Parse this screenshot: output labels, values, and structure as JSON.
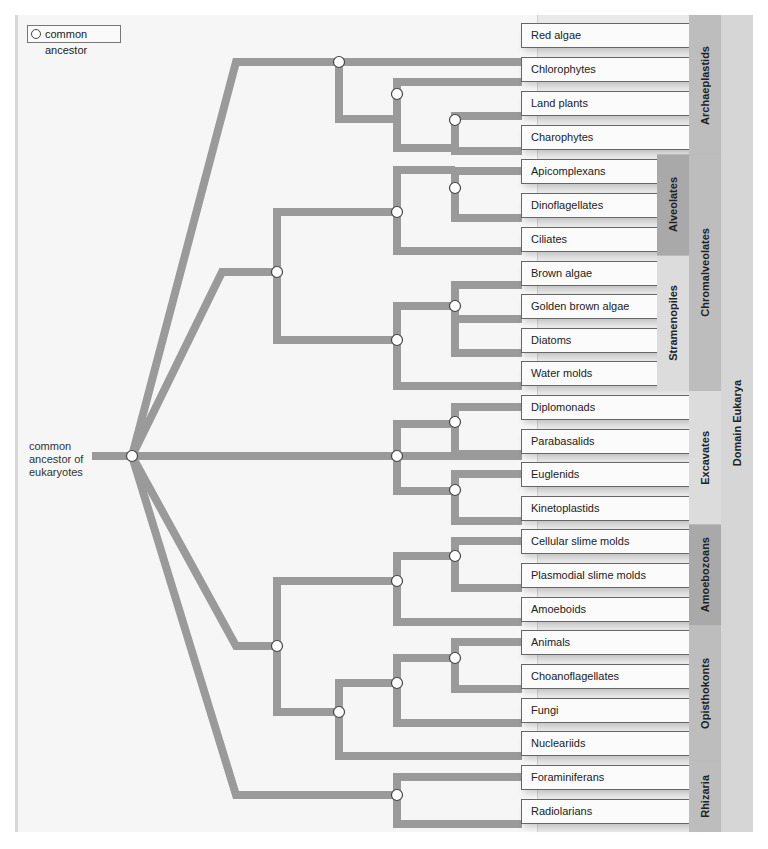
{
  "legend": {
    "label": "common ancestor",
    "icon": "circle-node-icon"
  },
  "root": {
    "label_lines": [
      "common",
      "ancestor of",
      "eukaryotes"
    ]
  },
  "colors": {
    "branch": "#9a9a9a",
    "node_fill": "#ffffff",
    "node_stroke": "#444444",
    "panel": "#f6f6f6",
    "label_panel": "#e9e9e9",
    "group_dark": "#a9a9a9",
    "group_mid": "#bdbdbd",
    "group_light": "#dcdcdc",
    "domain": "#d6d6d6"
  },
  "taxa": [
    {
      "label": "Red algae",
      "y": 35
    },
    {
      "label": "Chlorophytes",
      "y": 69
    },
    {
      "label": "Land plants",
      "y": 103
    },
    {
      "label": "Charophytes",
      "y": 137
    },
    {
      "label": "Apicomplexans",
      "y": 171
    },
    {
      "label": "Dinoflagellates",
      "y": 205
    },
    {
      "label": "Ciliates",
      "y": 239
    },
    {
      "label": "Brown algae",
      "y": 273
    },
    {
      "label": "Golden brown algae",
      "y": 306
    },
    {
      "label": "Diatoms",
      "y": 340
    },
    {
      "label": "Water molds",
      "y": 373
    },
    {
      "label": "Diplomonads",
      "y": 407
    },
    {
      "label": "Parabasalids",
      "y": 441
    },
    {
      "label": "Euglenids",
      "y": 474
    },
    {
      "label": "Kinetoplastids",
      "y": 508
    },
    {
      "label": "Cellular slime molds",
      "y": 541
    },
    {
      "label": "Plasmodial slime molds",
      "y": 575
    },
    {
      "label": "Amoeboids",
      "y": 609
    },
    {
      "label": "Animals",
      "y": 642
    },
    {
      "label": "Choanoflagellates",
      "y": 676
    },
    {
      "label": "Fungi",
      "y": 710
    },
    {
      "label": "Nucleariids",
      "y": 743
    },
    {
      "label": "Foraminiferans",
      "y": 777
    },
    {
      "label": "Radiolarians",
      "y": 811
    }
  ],
  "subgroups": [
    {
      "label": "Alveolates",
      "top": 154,
      "height": 101,
      "shade": "group_dark"
    },
    {
      "label": "Stramenopiles",
      "top": 255,
      "height": 135,
      "shade": "group_light"
    }
  ],
  "groups": [
    {
      "label": "Archaeplastids",
      "top": 15,
      "height": 139,
      "shade": "group_mid"
    },
    {
      "label": "Chromalveolates",
      "top": 154,
      "height": 236,
      "shade": "group_mid"
    },
    {
      "label": "Excavates",
      "top": 390,
      "height": 134,
      "shade": "group_light"
    },
    {
      "label": "Amoebozoans",
      "top": 524,
      "height": 101,
      "shade": "group_dark"
    },
    {
      "label": "Opisthokonts",
      "top": 625,
      "height": 135,
      "shade": "group_mid"
    },
    {
      "label": "Rhizaria",
      "top": 760,
      "height": 72,
      "shade": "group_mid"
    }
  ],
  "domain": {
    "label": "Domain Eukarya"
  }
}
